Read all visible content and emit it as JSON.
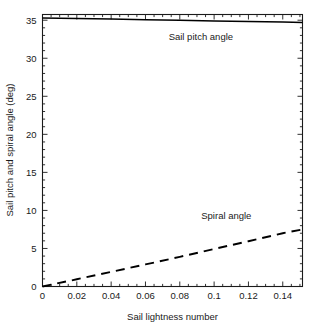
{
  "chart_data": {
    "type": "line",
    "title": "",
    "xlabel": "Sail lightness number",
    "ylabel": "Sail pitch and spiral angle (deg)",
    "xlim": [
      0,
      0.1515
    ],
    "ylim": [
      0,
      35.75
    ],
    "grid": false,
    "legend_position": "inline-annotations",
    "xticks": [
      0,
      0.02,
      0.04,
      0.06,
      0.08,
      0.1,
      0.12,
      0.14
    ],
    "xtick_labels": [
      "0",
      "0.02",
      "0.04",
      "0.06",
      "0.08",
      "0.1",
      "0.12",
      "0.14"
    ],
    "yticks": [
      0,
      5,
      10,
      15,
      20,
      25,
      30,
      35
    ],
    "ytick_labels": [
      "0",
      "5",
      "10",
      "15",
      "20",
      "25",
      "30",
      "35"
    ],
    "series": [
      {
        "name": "Sail pitch angle",
        "style": "solid",
        "color": "#000000",
        "x": [
          0,
          0.02,
          0.04,
          0.06,
          0.08,
          0.1,
          0.12,
          0.14,
          0.1515
        ],
        "values": [
          35.3,
          35.22,
          35.15,
          35.07,
          34.99,
          34.91,
          34.83,
          34.75,
          34.7
        ]
      },
      {
        "name": "Spiral angle",
        "style": "dashed",
        "color": "#000000",
        "x": [
          0,
          0.02,
          0.04,
          0.06,
          0.08,
          0.1,
          0.12,
          0.14,
          0.1515
        ],
        "values": [
          0,
          0.95,
          1.92,
          2.9,
          3.9,
          4.93,
          5.95,
          7.0,
          7.5
        ]
      }
    ],
    "annotations": [
      {
        "text": "Sail pitch angle",
        "x": 0.0735,
        "y": 32.4,
        "anchor": "start"
      },
      {
        "text": "Spiral angle",
        "x": 0.0925,
        "y": 8.85,
        "anchor": "start"
      }
    ]
  }
}
